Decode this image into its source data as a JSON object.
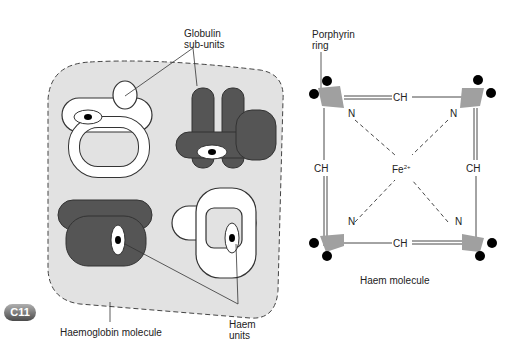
{
  "left_diagram": {
    "label_globulin": "Globulin sub-units",
    "label_globulin_line1": "Globulin",
    "label_globulin_line2": "sub-units",
    "label_haem_units_line1": "Haem",
    "label_haem_units_line2": "units",
    "label_molecule": "Haemoglobin molecule"
  },
  "right_diagram": {
    "label_porphyrin_line1": "Porphyrin",
    "label_porphyrin_line2": "ring",
    "label_ch": "CH",
    "label_n": "N",
    "label_fe": "Fe",
    "label_fe_charge": "2+",
    "label_molecule": "Haem molecule"
  },
  "badge": {
    "label": "C11"
  },
  "colors": {
    "background_shape": "#e2e2e2",
    "dark_subunit": "#555555",
    "light_subunit": "#ffffff",
    "pyrrole": "#a0a0a0"
  }
}
